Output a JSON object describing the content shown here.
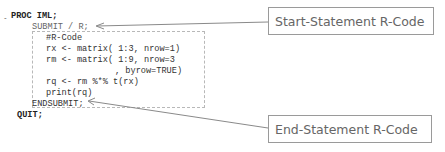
{
  "code": {
    "fold_toggle": "-",
    "lines": [
      {
        "text": "PROC IML;",
        "bold": true
      },
      {
        "text": "SUBMIT / R;",
        "bold": false
      },
      {
        "text": "#R-Code",
        "bold": false
      },
      {
        "text": "rx <- matrix( 1:3, nrow=1)",
        "bold": false
      },
      {
        "text": "rm <- matrix( 1:9, nrow=3",
        "bold": false
      },
      {
        "text": ", byrow=TRUE)",
        "bold": false
      },
      {
        "text": "rq <- rm %*% t(rx)",
        "bold": false
      },
      {
        "text": "print(rq)",
        "bold": false
      },
      {
        "text": "ENDSUBMIT;",
        "bold": false
      },
      {
        "text": "QUIT;",
        "bold": true
      }
    ]
  },
  "callouts": {
    "start": "Start-Statement R-Code",
    "end": "End-Statement R-Code"
  },
  "colors": {
    "callout_border": "#9a9a9a",
    "arrow": "#8a8a8a",
    "dashed_border": "#b8b8b8"
  }
}
